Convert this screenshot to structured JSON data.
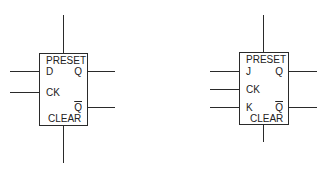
{
  "diagrams": [
    {
      "name": "D flip-flop",
      "labels": {
        "preset": "PRESET",
        "clear": "CLEAR",
        "inputs": [
          "D",
          "CK"
        ],
        "outputs": [
          "Q",
          "Q"
        ]
      }
    },
    {
      "name": "JK flip-flop",
      "labels": {
        "preset": "PRESET",
        "clear": "CLEAR",
        "inputs": [
          "J",
          "CK",
          "K"
        ],
        "outputs": [
          "Q",
          "Q"
        ]
      }
    }
  ]
}
